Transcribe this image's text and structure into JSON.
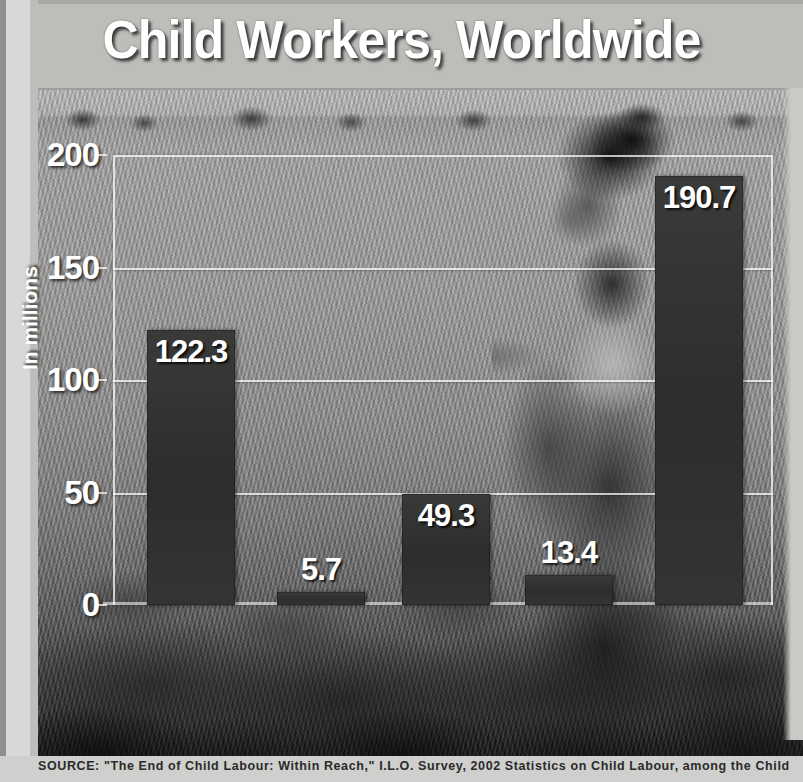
{
  "title": "Child Workers, Worldwide",
  "source": "SOURCE: \"The End of Child Labour: Within Reach,\" I.L.O. Survey, 2002 Statistics on Child Labour, among the Child",
  "colors": {
    "bar": "#2d2d2b",
    "text": "#ffffff",
    "grid": "rgba(255,255,255,0.72)"
  },
  "chart_data": {
    "type": "bar",
    "title": "Child Workers, Worldwide",
    "xlabel": "",
    "ylabel": "In millions",
    "ylim": [
      0,
      200
    ],
    "yticks": [
      0,
      50,
      100,
      150,
      200
    ],
    "grid": true,
    "legend": "none",
    "categories": [
      "Asia\nand\nPacific",
      "Latin\nAmerica\nand\nCaribbean",
      "Sub-\nSaharan\nAfrica",
      "Other\nRegions",
      "World"
    ],
    "values": [
      122.3,
      5.7,
      49.3,
      13.4,
      190.7
    ],
    "value_labels": [
      "122.3",
      "5.7",
      "49.3",
      "13.4",
      "190.7"
    ]
  },
  "ticks": [
    {
      "label": "200",
      "value": 200
    },
    {
      "label": "150",
      "value": 150
    },
    {
      "label": "100",
      "value": 100
    },
    {
      "label": "50",
      "value": 50
    },
    {
      "label": "0",
      "value": 0
    }
  ],
  "bars": [
    {
      "label": "Asia\nand\nPacific",
      "value": 122.3,
      "value_label": "122.3"
    },
    {
      "label": "Latin\nAmerica\nand\nCaribbean",
      "value": 5.7,
      "value_label": "5.7"
    },
    {
      "label": "Sub-\nSaharan\nAfrica",
      "value": 49.3,
      "value_label": "49.3"
    },
    {
      "label": "Other\nRegions",
      "value": 13.4,
      "value_label": "13.4"
    },
    {
      "label": "World",
      "value": 190.7,
      "value_label": "190.7"
    }
  ]
}
